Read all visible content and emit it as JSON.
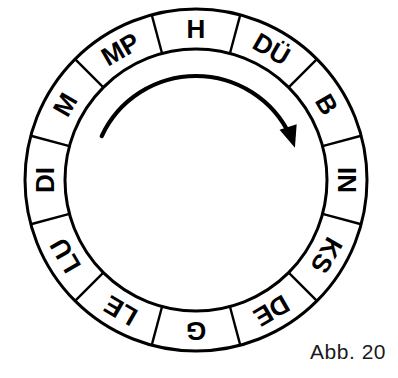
{
  "figure": {
    "title": "",
    "caption": "Abb. 20",
    "type": "cyclic-ring-diagram",
    "direction_label": "clockwise",
    "colors": {
      "stroke": "#000000",
      "fill": "#ffffff",
      "text": "#000000",
      "caption": "#1a1a1a"
    },
    "geometry": {
      "center_x": 196,
      "center_y": 180,
      "outer_radius": 171,
      "inner_radius": 131,
      "segment_count": 12,
      "segment_span_degrees": 30
    },
    "arrow": {
      "name": "clockwise-rotation-arrow",
      "radius": 104,
      "start_angle_degrees": 205,
      "end_angle_degrees": 335
    }
  },
  "ring": {
    "segments": [
      {
        "label": "H",
        "index": 0,
        "center_angle": 270
      },
      {
        "label": "DÜ",
        "index": 1,
        "center_angle": 300
      },
      {
        "label": "B",
        "index": 2,
        "center_angle": 330
      },
      {
        "label": "IN",
        "index": 3,
        "center_angle": 0
      },
      {
        "label": "KS",
        "index": 4,
        "center_angle": 30
      },
      {
        "label": "DE",
        "index": 5,
        "center_angle": 60
      },
      {
        "label": "G",
        "index": 6,
        "center_angle": 90
      },
      {
        "label": "LE",
        "index": 7,
        "center_angle": 120
      },
      {
        "label": "LU",
        "index": 8,
        "center_angle": 150
      },
      {
        "label": "DI",
        "index": 9,
        "center_angle": 180
      },
      {
        "label": "M",
        "index": 10,
        "center_angle": 210
      },
      {
        "label": "MP",
        "index": 11,
        "center_angle": 240
      }
    ]
  }
}
